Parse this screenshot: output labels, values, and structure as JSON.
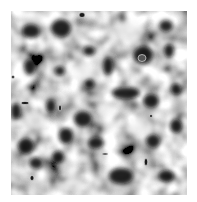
{
  "image": {
    "description": "Grayscale smooth noise texture with dark and light blobs",
    "background": "#ffffff",
    "palette": {
      "dark": "#0a0a0a",
      "mid": "#8a8a8a",
      "light": "#f2f2f2"
    },
    "area": {
      "x": 11,
      "y": 11,
      "width": 176,
      "height": 184
    }
  }
}
